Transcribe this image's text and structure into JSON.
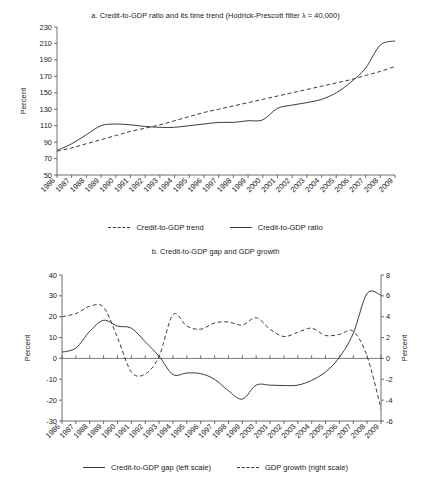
{
  "figure": {
    "background_color": "#ffffff",
    "line_color": "#3c3c3c",
    "axis_color": "#4a4a4a"
  },
  "panel_a": {
    "title": "a. Credit-to-GDP ratio and its time trend (Hodrick-Prescott filter λ = 40,000)",
    "ylabel": "Percent",
    "legend": [
      {
        "label": "Credit-to-GDP trend",
        "style": "dashed"
      },
      {
        "label": "Credit-to-GDP ratio",
        "style": "solid"
      }
    ]
  },
  "panel_b": {
    "title": "b. Credit-to-GDP gap and GDP growth",
    "ylabel_left": "Percent",
    "ylabel_right": "Percent",
    "legend": [
      {
        "label": "Credit-to-GDP gap (left scale)",
        "style": "solid"
      },
      {
        "label": "GDP growth (right scale)",
        "style": "dashed"
      }
    ]
  },
  "chart_data": [
    {
      "type": "line",
      "title": "a. Credit-to-GDP ratio and its time trend (Hodrick-Prescott filter λ = 40,000)",
      "xlabel": "",
      "ylabel": "Percent",
      "ylim": [
        50,
        230
      ],
      "yticks": [
        50,
        70,
        90,
        110,
        130,
        150,
        170,
        190,
        210,
        230
      ],
      "grid": false,
      "legend_position": "bottom",
      "categories": [
        1986,
        1987,
        1988,
        1989,
        1990,
        1991,
        1992,
        1993,
        1994,
        1995,
        1996,
        1997,
        1998,
        1999,
        2000,
        2001,
        2002,
        2003,
        2004,
        2005,
        2006,
        2007,
        2008,
        2009
      ],
      "series": [
        {
          "name": "Credit-to-GDP ratio",
          "style": "solid",
          "values": [
            80,
            88,
            99,
            110,
            112,
            111,
            109,
            108,
            108,
            110,
            112,
            114,
            114,
            116,
            117,
            131,
            135,
            138,
            142,
            150,
            163,
            180,
            208,
            213
          ]
        },
        {
          "name": "Credit-to-GDP trend",
          "style": "dashed",
          "values": [
            79,
            83,
            88,
            93,
            98,
            103,
            107,
            111,
            116,
            121,
            126,
            130,
            134,
            138,
            142,
            146,
            150,
            154,
            158,
            162,
            166,
            171,
            176,
            182
          ]
        }
      ]
    },
    {
      "type": "line",
      "title": "b. Credit-to-GDP gap and GDP growth",
      "xlabel": "",
      "ylabel": "Percent",
      "ylabel_right": "Percent",
      "ylim": [
        -30,
        40
      ],
      "yticks": [
        -30,
        -20,
        -10,
        0,
        10,
        20,
        30,
        40
      ],
      "ylim_right": [
        -6,
        8
      ],
      "yticks_right": [
        -6,
        -4,
        -2,
        0,
        2,
        4,
        6,
        8
      ],
      "grid": false,
      "legend_position": "bottom",
      "categories": [
        1986,
        1987,
        1988,
        1989,
        1990,
        1991,
        1992,
        1993,
        1994,
        1995,
        1996,
        1997,
        1998,
        1999,
        2000,
        2001,
        2002,
        2003,
        2004,
        2005,
        2006,
        2007,
        2008,
        2009
      ],
      "series": [
        {
          "name": "Credit-to-GDP gap (left scale)",
          "axis": "left",
          "style": "solid",
          "values": [
            3.0,
            5.0,
            13.0,
            18.3,
            15.5,
            14.5,
            8.0,
            1.0,
            -7.7,
            -7.0,
            -7.3,
            -10.0,
            -15.5,
            -19.5,
            -12.8,
            -12.8,
            -13.0,
            -12.8,
            -10.5,
            -6.5,
            0.5,
            12.0,
            31.2,
            30.3
          ]
        },
        {
          "name": "GDP growth (right scale)",
          "axis": "right",
          "style": "dashed",
          "values": [
            4.0,
            4.3,
            5.0,
            4.9,
            2.0,
            -1.3,
            -1.5,
            0.2,
            4.2,
            3.1,
            2.8,
            3.4,
            3.5,
            3.2,
            3.9,
            2.8,
            2.1,
            2.5,
            2.9,
            2.2,
            2.3,
            2.6,
            0.2,
            -4.8
          ]
        }
      ]
    }
  ]
}
